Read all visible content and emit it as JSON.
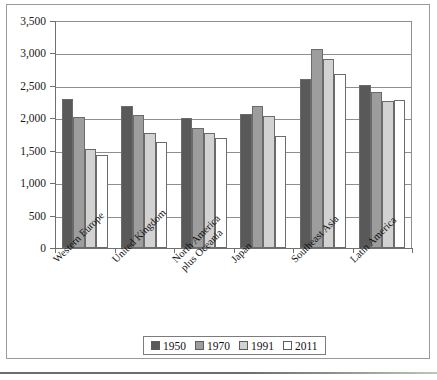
{
  "chart_data": {
    "type": "bar",
    "title": "",
    "subtitle": "",
    "xlabel": "",
    "ylabel": "",
    "ylim": [
      0,
      3500
    ],
    "ytick_step": 500,
    "grid": true,
    "legend_position": "bottom",
    "categories": [
      "Western Europe",
      "United Kingdom",
      "North America plus Oceania",
      "Japan",
      "Southeast Asia",
      "Latin America"
    ],
    "category_lines": [
      [
        "Western Europe"
      ],
      [
        "United Kingdom"
      ],
      [
        "North America",
        "plus Oceania"
      ],
      [
        "Japan"
      ],
      [
        "Southeast Asia"
      ],
      [
        "Latin America"
      ]
    ],
    "ytick_labels": [
      "0",
      "500",
      "1,000",
      "1,500",
      "2,000",
      "2,500",
      "3,000",
      "3,500"
    ],
    "ytick_values": [
      0,
      500,
      1000,
      1500,
      2000,
      2500,
      3000,
      3500
    ],
    "series": [
      {
        "name": "1950",
        "color": "#595959",
        "values": [
          2300,
          2190,
          2010,
          2070,
          2610,
          2520
        ]
      },
      {
        "name": "1970",
        "color": "#9d9d9d",
        "values": [
          2020,
          2050,
          1850,
          2190,
          3070,
          2410
        ]
      },
      {
        "name": "1991",
        "color": "#d2d2d2",
        "values": [
          1520,
          1770,
          1770,
          2030,
          2920,
          2270
        ]
      },
      {
        "name": "2011",
        "color": "#ffffff",
        "values": [
          1430,
          1640,
          1700,
          1720,
          2680,
          2280
        ]
      }
    ]
  }
}
